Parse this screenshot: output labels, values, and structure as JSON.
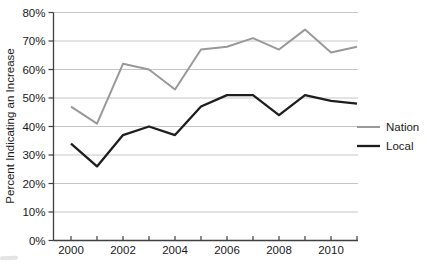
{
  "figure": {
    "background": "#ffffff"
  },
  "chart_data": {
    "type": "line",
    "title": "",
    "xlabel": "",
    "ylabel": "Percent Indicating an Increase",
    "x": [
      2000,
      2001,
      2002,
      2003,
      2004,
      2005,
      2006,
      2007,
      2008,
      2009,
      2010,
      2011
    ],
    "x_tick_labels": [
      "2000",
      "2002",
      "2004",
      "2006",
      "2008",
      "2010"
    ],
    "y_ticks": [
      0,
      10,
      20,
      30,
      40,
      50,
      60,
      70,
      80
    ],
    "y_tick_suffix": "%",
    "ylim": [
      0,
      80
    ],
    "grid": "horizontal",
    "legend_position": "right-middle",
    "series": [
      {
        "name": "Nation",
        "color": "#999999",
        "values": [
          47,
          41,
          62,
          60,
          53,
          67,
          68,
          71,
          67,
          74,
          66,
          68
        ]
      },
      {
        "name": "Local",
        "color": "#1d1d1d",
        "values": [
          34,
          26,
          37,
          40,
          37,
          47,
          51,
          51,
          44,
          51,
          49,
          48
        ]
      }
    ],
    "colors": {
      "gridline": "#c6c6c6",
      "axis": "#3f3f3f",
      "text": "#1a1a1a",
      "background": "#ffffff"
    }
  }
}
